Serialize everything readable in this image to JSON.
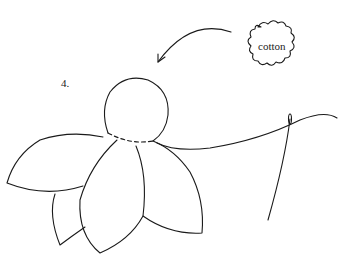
{
  "diagram": {
    "step_number": "4.",
    "cloud_label": "cotton",
    "stroke_color": "#1a1a1a",
    "background": "#ffffff"
  }
}
